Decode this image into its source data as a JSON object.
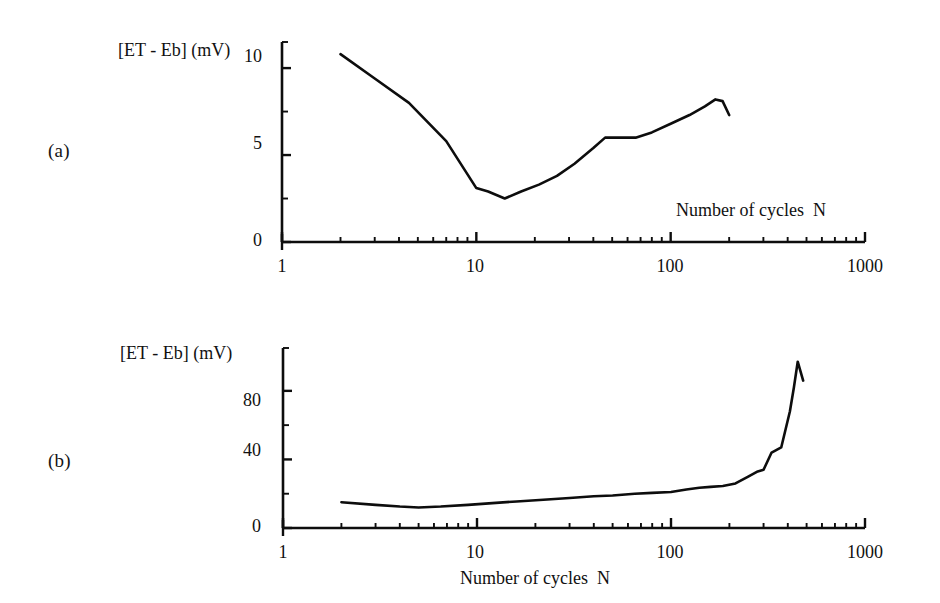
{
  "figure": {
    "background": "#ffffff",
    "ink_color": "#0d0d0d"
  },
  "panels": [
    {
      "label": "(a)",
      "y_axis_title": "[ET - Eb] (mV)",
      "x_axis_title": "Number of cycles  N",
      "x_tick_labels": [
        "1",
        "10",
        "100",
        "1000"
      ],
      "y_tick_labels": [
        "0",
        "5",
        "10"
      ]
    },
    {
      "label": "(b)",
      "y_axis_title": "[ET - Eb] (mV)",
      "x_axis_title": "Number of cycles  N",
      "x_tick_labels": [
        "1",
        "10",
        "100",
        "1000"
      ],
      "y_tick_labels": [
        "0",
        "40",
        "80"
      ]
    }
  ],
  "chart_data": [
    {
      "type": "line",
      "panel": "(a)",
      "title": "",
      "xlabel": "Number of cycles  N",
      "ylabel": "[ET - Eb] (mV)",
      "xscale": "log",
      "yscale": "linear",
      "xlim": [
        1,
        1000
      ],
      "ylim": [
        0,
        11.5
      ],
      "xticks": [
        1,
        10,
        100,
        1000
      ],
      "xtick_labels": [
        "1",
        "10",
        "100",
        "1000"
      ],
      "yticks": [
        0,
        5,
        10
      ],
      "ytick_labels": [
        "0",
        "5",
        "10"
      ],
      "yticks_minor": [
        2.5,
        7.5
      ],
      "grid": false,
      "legend": false,
      "series": [
        {
          "name": "[ET - Eb]",
          "x": [
            2.0,
            3.0,
            4.5,
            7.0,
            10.0,
            11.5,
            14.0,
            17.0,
            21.0,
            26.0,
            32.0,
            40.0,
            46.0,
            55.0,
            66.0,
            80.0,
            100.0,
            125.0,
            150.0,
            170.0,
            185.0,
            200.0
          ],
          "y": [
            10.8,
            9.4,
            8.0,
            5.8,
            3.1,
            2.9,
            2.5,
            2.9,
            3.3,
            3.8,
            4.5,
            5.4,
            6.0,
            6.0,
            6.0,
            6.3,
            6.8,
            7.3,
            7.8,
            8.2,
            8.1,
            7.3
          ]
        }
      ]
    },
    {
      "type": "line",
      "panel": "(b)",
      "title": "",
      "xlabel": "Number of cycles  N",
      "ylabel": "[ET - Eb] (mV)",
      "xscale": "log",
      "yscale": "linear",
      "xlim": [
        1,
        1000
      ],
      "ylim": [
        0,
        105
      ],
      "xticks": [
        1,
        10,
        100,
        1000
      ],
      "xtick_labels": [
        "1",
        "10",
        "100",
        "1000"
      ],
      "yticks": [
        0,
        40,
        80
      ],
      "ytick_labels": [
        "0",
        "40",
        "80"
      ],
      "yticks_minor": [
        20,
        60
      ],
      "grid": false,
      "legend": false,
      "series": [
        {
          "name": "[ET - Eb]",
          "x": [
            2.0,
            3.0,
            4.0,
            5.0,
            6.5,
            9.0,
            12.0,
            16.0,
            22.0,
            30.0,
            40.0,
            50.0,
            65.0,
            80.0,
            100.0,
            120.0,
            140.0,
            160.0,
            185.0,
            215.0,
            250.0,
            280.0,
            300.0,
            330.0,
            370.0,
            410.0,
            430.0,
            450.0,
            480.0
          ],
          "y": [
            15.0,
            13.5,
            12.5,
            12.0,
            12.5,
            13.5,
            14.5,
            15.5,
            16.5,
            17.5,
            18.5,
            19.0,
            20.0,
            20.5,
            21.0,
            22.5,
            23.5,
            24.0,
            24.5,
            26.0,
            30.0,
            33.0,
            34.0,
            44.0,
            47.0,
            68.0,
            82.0,
            97.0,
            86.0
          ]
        }
      ]
    }
  ]
}
